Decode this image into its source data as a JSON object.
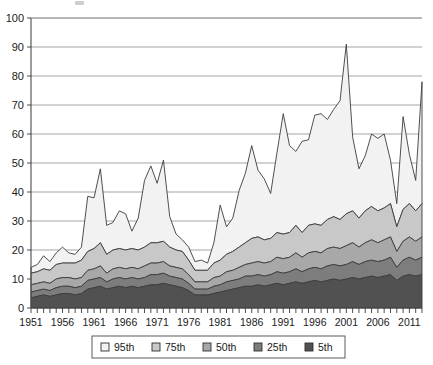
{
  "chart_data": {
    "type": "area",
    "stacked": true,
    "title": "",
    "xlabel": "",
    "ylabel": "",
    "ylim": [
      0,
      100
    ],
    "yticks": [
      0,
      10,
      20,
      30,
      40,
      50,
      60,
      70,
      80,
      90,
      100
    ],
    "xlim": [
      1951,
      2013
    ],
    "xtick_labels": [
      "1951",
      "1956",
      "1961",
      "1966",
      "1971",
      "1976",
      "1981",
      "1986",
      "1991",
      "1996",
      "2001",
      "2006",
      "2011"
    ],
    "xtick_values": [
      1951,
      1956,
      1961,
      1966,
      1971,
      1976,
      1981,
      1986,
      1991,
      1996,
      2001,
      2006,
      2011
    ],
    "minor_xtick_interval": 1,
    "grid": true,
    "grid_axis": "y",
    "legend_position": "bottom",
    "legend_entries": [
      "95th",
      "75th",
      "50th",
      "25th",
      "5th"
    ],
    "stack_order_bottom_to_top": [
      "5th",
      "25th",
      "50th",
      "75th",
      "95th"
    ],
    "colors": {
      "95th": "#f2f2f2",
      "75th": "#c8c8c8",
      "50th": "#a8a8a8",
      "25th": "#7d7d7d",
      "5th": "#515151",
      "outline": "#3c3c3c",
      "gridline": "#8d8d8d",
      "axis": "#4a4a4a",
      "text": "#1a1a1a",
      "background": "#ffffff"
    },
    "x": [
      1951,
      1952,
      1953,
      1954,
      1955,
      1956,
      1957,
      1958,
      1959,
      1960,
      1961,
      1962,
      1963,
      1964,
      1965,
      1966,
      1967,
      1968,
      1969,
      1970,
      1971,
      1972,
      1973,
      1974,
      1975,
      1976,
      1977,
      1978,
      1979,
      1980,
      1981,
      1982,
      1983,
      1984,
      1985,
      1986,
      1987,
      1988,
      1989,
      1990,
      1991,
      1992,
      1993,
      1994,
      1995,
      1996,
      1997,
      1998,
      1999,
      2000,
      2001,
      2002,
      2003,
      2004,
      2005,
      2006,
      2007,
      2008,
      2009,
      2010,
      2011,
      2012,
      2013
    ],
    "series": [
      {
        "name": "5th",
        "values": [
          3.5,
          4.0,
          4.5,
          4.0,
          4.5,
          5.0,
          5.0,
          4.5,
          5.0,
          6.5,
          7.0,
          7.5,
          6.5,
          7.0,
          7.5,
          7.0,
          7.5,
          7.0,
          7.5,
          8.0,
          8.0,
          8.5,
          8.0,
          7.5,
          7.0,
          6.0,
          4.5,
          4.5,
          4.5,
          5.0,
          5.5,
          6.0,
          6.5,
          7.0,
          7.5,
          7.5,
          8.0,
          7.5,
          8.0,
          8.5,
          8.0,
          8.5,
          9.0,
          8.5,
          9.0,
          9.5,
          9.0,
          9.5,
          10.0,
          9.5,
          10.0,
          10.5,
          10.0,
          10.5,
          11.0,
          10.5,
          11.0,
          11.5,
          9.5,
          11.0,
          11.5,
          11.0,
          11.5
        ]
      },
      {
        "name": "25th",
        "values": [
          2.0,
          2.0,
          2.0,
          2.0,
          2.5,
          2.5,
          2.5,
          2.5,
          2.5,
          3.0,
          3.0,
          3.0,
          2.5,
          3.0,
          3.0,
          3.0,
          3.0,
          3.0,
          3.0,
          3.5,
          3.5,
          3.5,
          3.0,
          3.0,
          3.0,
          2.5,
          2.0,
          2.0,
          2.0,
          2.5,
          2.5,
          3.0,
          3.0,
          3.0,
          3.5,
          3.5,
          3.5,
          3.5,
          3.5,
          4.0,
          4.0,
          4.0,
          4.5,
          4.0,
          4.5,
          4.5,
          4.5,
          5.0,
          5.0,
          5.0,
          5.0,
          5.5,
          5.0,
          5.5,
          5.5,
          5.5,
          5.5,
          6.0,
          4.5,
          5.5,
          6.0,
          5.5,
          6.0
        ]
      },
      {
        "name": "50th",
        "values": [
          2.5,
          2.5,
          2.5,
          2.5,
          3.0,
          3.0,
          3.0,
          3.0,
          3.0,
          3.5,
          3.5,
          4.0,
          3.0,
          3.5,
          3.5,
          3.5,
          3.5,
          3.5,
          4.0,
          4.0,
          4.0,
          4.0,
          3.5,
          3.5,
          3.5,
          3.0,
          2.5,
          2.5,
          2.5,
          3.0,
          3.0,
          3.5,
          3.5,
          4.0,
          4.0,
          4.5,
          4.5,
          4.5,
          4.5,
          5.0,
          5.0,
          5.0,
          5.5,
          5.0,
          5.5,
          5.5,
          5.5,
          6.0,
          6.0,
          6.0,
          6.5,
          6.5,
          6.0,
          6.5,
          7.0,
          6.5,
          7.0,
          7.0,
          5.5,
          6.5,
          7.0,
          6.5,
          7.0
        ]
      },
      {
        "name": "75th",
        "values": [
          4.0,
          4.0,
          4.5,
          4.5,
          5.0,
          5.0,
          5.0,
          5.5,
          6.0,
          6.5,
          7.0,
          8.0,
          6.5,
          6.5,
          6.5,
          6.5,
          6.5,
          6.5,
          6.5,
          7.0,
          7.0,
          7.0,
          6.5,
          6.0,
          6.0,
          5.0,
          4.0,
          4.0,
          4.0,
          5.0,
          5.5,
          6.0,
          6.5,
          7.0,
          7.5,
          8.5,
          8.5,
          8.0,
          8.0,
          8.5,
          8.5,
          8.5,
          9.5,
          8.5,
          9.5,
          9.5,
          9.5,
          10.0,
          10.5,
          10.0,
          11.0,
          11.0,
          10.0,
          11.0,
          11.5,
          11.0,
          11.0,
          11.5,
          8.5,
          11.0,
          11.5,
          10.5,
          11.5
        ]
      },
      {
        "name": "95th",
        "values": [
          2.0,
          2.5,
          4.5,
          3.0,
          4.0,
          5.5,
          3.5,
          3.0,
          4.5,
          19.0,
          17.5,
          25.5,
          10.0,
          9.5,
          13.0,
          12.5,
          6.0,
          11.0,
          23.0,
          26.5,
          20.5,
          28.0,
          10.5,
          5.5,
          4.0,
          4.5,
          3.0,
          3.5,
          2.5,
          7.0,
          19.0,
          9.5,
          11.5,
          19.5,
          24.0,
          32.0,
          23.0,
          21.0,
          15.5,
          27.5,
          41.5,
          30.0,
          25.5,
          31.5,
          29.5,
          37.5,
          38.5,
          34.5,
          37.0,
          41.0,
          58.5,
          25.5,
          17.0,
          19.0,
          25.0,
          25.0,
          25.5,
          15.0,
          8.0,
          32.0,
          17.0,
          10.5,
          42.0
        ]
      }
    ],
    "cumulative_totals": [
      14.0,
      15.0,
      18.0,
      16.0,
      19.0,
      21.0,
      19.0,
      18.5,
      21.0,
      38.5,
      38.0,
      48.0,
      28.5,
      29.5,
      33.5,
      32.5,
      26.5,
      31.0,
      44.0,
      49.0,
      43.0,
      51.0,
      41.5,
      25.5,
      23.5,
      21.0,
      16.0,
      16.5,
      15.5,
      22.5,
      35.5,
      28.0,
      31.0,
      40.5,
      46.5,
      56.0,
      47.5,
      44.5,
      39.5,
      53.5,
      67.0,
      56.0,
      54.0,
      57.5,
      58.0,
      66.5,
      67.0,
      65.0,
      68.5,
      71.5,
      91.0,
      59.0,
      48.0,
      52.5,
      60.0,
      58.5,
      60.0,
      51.0,
      36.0,
      66.0,
      53.0,
      44.0,
      78.0
    ]
  }
}
